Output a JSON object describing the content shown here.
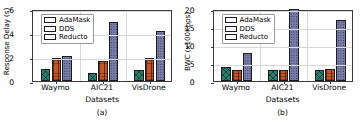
{
  "figure": {
    "series": [
      {
        "name": "AdaMask",
        "color": "#2e7d6e",
        "hatch": "cross-x"
      },
      {
        "name": "DDS",
        "color": "#c4552a",
        "hatch": "vertical-lines"
      },
      {
        "name": "Reducto",
        "color": "#787ca8",
        "hatch": "dots"
      }
    ]
  },
  "chart_data": [
    {
      "type": "bar",
      "panel": "a",
      "caption": "(a)",
      "title": "",
      "xlabel": "Datasets",
      "ylabel": "Response Delay (s)",
      "categories": [
        "Waymo",
        "AIC21",
        "VisDrone"
      ],
      "yticks": [
        0,
        2,
        4,
        6
      ],
      "ylim": [
        0,
        6
      ],
      "grid": true,
      "legend_position": "upper left",
      "series": [
        {
          "name": "AdaMask",
          "values": [
            1.0,
            0.7,
            0.9
          ]
        },
        {
          "name": "DDS",
          "values": [
            1.95,
            1.65,
            1.9
          ]
        },
        {
          "name": "Reducto",
          "values": [
            2.05,
            4.9,
            4.15
          ]
        }
      ]
    },
    {
      "type": "bar",
      "panel": "b",
      "caption": "(b)",
      "title": "",
      "xlabel": "Datasets",
      "ylabel": "BWC (x100Kbps)",
      "categories": [
        "Waymo",
        "AIC21",
        "VisDrone"
      ],
      "yticks": [
        0,
        5,
        10,
        15,
        20
      ],
      "ylim": [
        0,
        20
      ],
      "grid": true,
      "legend_position": "upper left",
      "series": [
        {
          "name": "AdaMask",
          "values": [
            3.8,
            3.1,
            3.1
          ]
        },
        {
          "name": "DDS",
          "values": [
            3.0,
            3.1,
            3.4
          ]
        },
        {
          "name": "Reducto",
          "values": [
            7.8,
            20.0,
            16.9
          ]
        }
      ]
    }
  ]
}
